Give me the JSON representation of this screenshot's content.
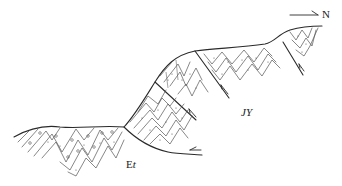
{
  "figure": {
    "type": "geological cross-section",
    "north_arrow": {
      "label": "N",
      "direction": "right"
    },
    "formations": [
      {
        "id": "Et",
        "label_prefix": "E",
        "label_suffix": "t",
        "position": "lower-left footwall"
      },
      {
        "id": "JY",
        "label": "JY",
        "position": "right hanging wall"
      }
    ],
    "faults": [
      {
        "name": "basal thrust",
        "movement": "half-arrow pointing left (sinistral/top-to-south)"
      },
      {
        "name": "thrust fault 1",
        "movement": "half-arrow pointing up"
      },
      {
        "name": "thrust fault 2",
        "movement": "half-arrow pointing up"
      },
      {
        "name": "thrust fault 3",
        "movement": "half-arrow pointing up"
      }
    ],
    "colors": {
      "line": "#2a2a2a",
      "bedding": "#555555",
      "background": "#ffffff"
    }
  }
}
